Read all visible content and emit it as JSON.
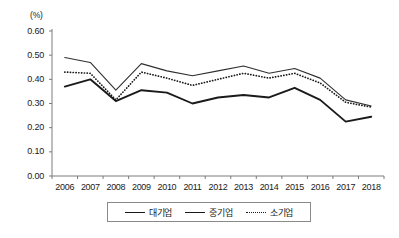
{
  "chart_data": {
    "type": "line",
    "title": "",
    "xlabel": "",
    "ylabel": "(%)",
    "unit_label": "(%)",
    "categories": [
      "2006",
      "2007",
      "2008",
      "2009",
      "2010",
      "2011",
      "2012",
      "2013",
      "2014",
      "2015",
      "2016",
      "2017",
      "2018"
    ],
    "ylim": [
      0.0,
      0.6
    ],
    "ytick_labels": [
      "0.00",
      "0.10",
      "0.20",
      "0.30",
      "0.40",
      "0.50",
      "0.60"
    ],
    "ytick_values": [
      0.0,
      0.1,
      0.2,
      0.3,
      0.4,
      0.5,
      0.6
    ],
    "grid": false,
    "legend_position": "bottom",
    "series": [
      {
        "name": "대기업",
        "style": "solid-thick",
        "values": [
          0.37,
          0.4,
          0.31,
          0.355,
          0.345,
          0.3,
          0.325,
          0.335,
          0.325,
          0.365,
          0.315,
          0.225,
          0.245
        ]
      },
      {
        "name": "중기업",
        "style": "solid-thin",
        "values": [
          0.49,
          0.47,
          0.355,
          0.465,
          0.435,
          0.415,
          0.435,
          0.455,
          0.425,
          0.445,
          0.405,
          0.315,
          0.29
        ]
      },
      {
        "name": "소기업",
        "style": "dotted",
        "values": [
          0.43,
          0.425,
          0.315,
          0.43,
          0.405,
          0.375,
          0.4,
          0.425,
          0.405,
          0.425,
          0.385,
          0.305,
          0.285
        ]
      }
    ]
  },
  "legend": {
    "items": [
      {
        "label": "대기업",
        "style": "thick"
      },
      {
        "label": "중기업",
        "style": "thin"
      },
      {
        "label": "소기업",
        "style": "dotted"
      }
    ]
  }
}
